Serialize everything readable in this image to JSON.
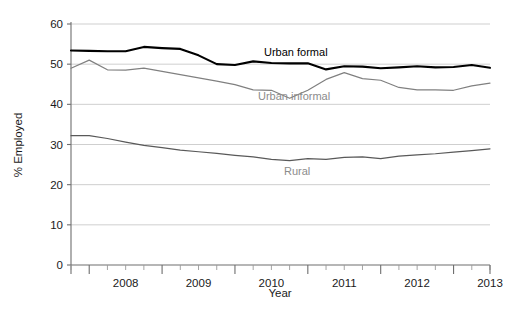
{
  "chart_data": {
    "type": "line",
    "title": "",
    "xlabel": "Year",
    "ylabel": "% Employed",
    "ylim": [
      0,
      60
    ],
    "yticks": [
      0,
      10,
      20,
      30,
      40,
      50,
      60
    ],
    "xlim": [
      2007.75,
      2013.5
    ],
    "xticks": [
      2008,
      2009,
      2010,
      2011,
      2012,
      2013
    ],
    "xtick_labels": [
      "2008",
      "2009",
      "2010",
      "2011",
      "2012",
      "2013"
    ],
    "minor_xticks_per_interval": 3,
    "grid": "horizontal",
    "legend_position": "inline-annotations",
    "x": [
      2007.75,
      2008.0,
      2008.25,
      2008.5,
      2008.75,
      2009.0,
      2009.25,
      2009.5,
      2009.75,
      2010.0,
      2010.25,
      2010.5,
      2010.75,
      2011.0,
      2011.25,
      2011.5,
      2011.75,
      2012.0,
      2012.25,
      2012.5,
      2012.75,
      2013.0,
      2013.25,
      2013.5
    ],
    "series": [
      {
        "name": "Urban formal",
        "color": "#000000",
        "width": 2.1,
        "values": [
          53.4,
          53.3,
          53.2,
          53.2,
          54.3,
          54.0,
          53.8,
          52.2,
          50.0,
          49.8,
          50.7,
          50.3,
          50.2,
          50.2,
          48.7,
          49.5,
          49.4,
          49.0,
          49.2,
          49.5,
          49.2,
          49.3,
          49.8,
          49.1
        ]
      },
      {
        "name": "Urban informal",
        "color": "#808080",
        "width": 1.2,
        "values": [
          49.0,
          51.0,
          48.6,
          48.5,
          49.0,
          48.2,
          47.4,
          46.6,
          45.8,
          44.9,
          43.6,
          43.5,
          41.5,
          43.5,
          46.2,
          47.9,
          46.4,
          46.0,
          44.2,
          43.6,
          43.6,
          43.5,
          44.6,
          45.3
        ]
      },
      {
        "name": "Rural",
        "color": "#595959",
        "width": 1.2,
        "values": [
          32.2,
          32.2,
          31.5,
          30.6,
          29.8,
          29.2,
          28.6,
          28.2,
          27.8,
          27.3,
          26.9,
          26.3,
          26.0,
          26.5,
          26.3,
          26.8,
          26.9,
          26.5,
          27.1,
          27.4,
          27.7,
          28.1,
          28.5,
          28.9
        ]
      }
    ],
    "annotations": [
      {
        "text": "Urban formal",
        "color": "#000000",
        "x_px": 264,
        "y_px": 56
      },
      {
        "text": "Urban informal",
        "color": "#8c8c8c",
        "x_px": 258,
        "y_px": 100
      },
      {
        "text": "Rural",
        "color": "#8c8c8c",
        "x_px": 284,
        "y_px": 175
      }
    ]
  }
}
